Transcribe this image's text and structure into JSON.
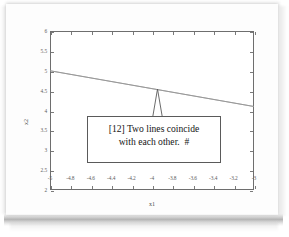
{
  "chart_data": {
    "type": "line",
    "title": "",
    "xlabel": "x1",
    "ylabel": "x2",
    "xlim": [
      -5,
      -3
    ],
    "ylim": [
      2,
      6
    ],
    "grid": false,
    "legend": null,
    "xticks": [
      "-5",
      "-4.8",
      "-4.6",
      "-4.4",
      "-4.2",
      "-4",
      "-3.8",
      "-3.6",
      "-3.4",
      "-3.2",
      "-3"
    ],
    "xtick_values": [
      -5,
      -4.8,
      -4.6,
      -4.4,
      -4.2,
      -4,
      -3.8,
      -3.6,
      -3.4,
      -3.2,
      -3
    ],
    "yticks": [
      "2",
      "2.5",
      "3",
      "3.5",
      "4",
      "4.5",
      "5",
      "5.5",
      "6"
    ],
    "ytick_values": [
      2,
      2.5,
      3,
      3.5,
      4,
      4.5,
      5,
      5.5,
      6
    ],
    "series": [
      {
        "name": "line-1",
        "x": [
          -5,
          -3
        ],
        "values": [
          5.0,
          4.1
        ]
      },
      {
        "name": "line-2",
        "x": [
          -5,
          -3
        ],
        "values": [
          5.0,
          4.1
        ]
      }
    ],
    "annotations": [
      {
        "name": "coincide-callout",
        "lines": [
          "[12] Two lines coincide",
          "with each other.  #"
        ],
        "points_to": {
          "x": -4.02,
          "y": 4.55
        }
      }
    ]
  },
  "annotation": {
    "line1": "[12] Two lines coincide",
    "line2": "with each other.  #"
  },
  "axes": {
    "xlabel": "x1",
    "ylabel": "x2"
  },
  "colors": {
    "axis": "#6e6e6e",
    "data_line": "#8a8a8a",
    "text": "#151515",
    "page": "#fdfdfd"
  }
}
